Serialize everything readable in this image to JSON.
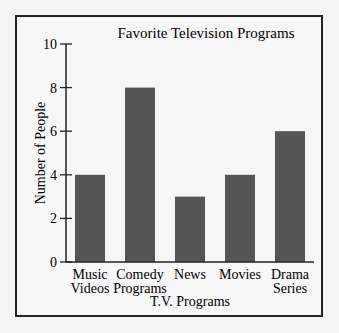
{
  "chart_data": {
    "type": "bar",
    "title": "Favorite Television Programs",
    "xlabel": "T.V. Programs",
    "ylabel": "Number of People",
    "categories": [
      [
        "Music",
        "Videos"
      ],
      [
        "Comedy",
        "Programs"
      ],
      [
        "News"
      ],
      [
        "Movies"
      ],
      [
        "Drama",
        "Series"
      ]
    ],
    "category_names": [
      "Music Videos",
      "Comedy Programs",
      "News",
      "Movies",
      "Drama Series"
    ],
    "values": [
      4,
      8,
      3,
      4,
      6
    ],
    "ylim": [
      0,
      10
    ],
    "yticks": [
      0,
      2,
      4,
      6,
      8,
      10
    ],
    "grid": false,
    "legend": null,
    "bar_color": "#555555"
  }
}
